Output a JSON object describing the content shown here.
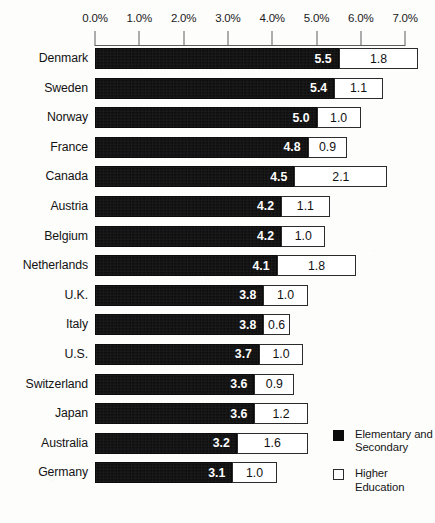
{
  "chart_data": {
    "type": "bar",
    "orientation": "horizontal",
    "stacked": true,
    "title": "",
    "subtitle": "",
    "xlabel": "",
    "ylabel": "",
    "xlim": [
      0.0,
      7.0
    ],
    "grid": false,
    "legend_position": "bottom-right",
    "axis_tick_labels": [
      "0.0%",
      "1.0%",
      "2.0%",
      "3.0%",
      "4.0%",
      "5.0%",
      "6.0%",
      "7.0%"
    ],
    "axis_tick_values": [
      0.0,
      1.0,
      2.0,
      3.0,
      4.0,
      5.0,
      6.0,
      7.0
    ],
    "categories": [
      "Denmark",
      "Sweden",
      "Norway",
      "France",
      "Canada",
      "Austria",
      "Belgium",
      "Netherlands",
      "U.K.",
      "Italy",
      "U.S.",
      "Switzerland",
      "Japan",
      "Australia",
      "Germany"
    ],
    "series": [
      {
        "name": "Elementary and Secondary",
        "color": "#0b0b0b",
        "values": [
          5.5,
          5.4,
          5.0,
          4.8,
          4.5,
          4.2,
          4.2,
          4.1,
          3.8,
          3.8,
          3.7,
          3.6,
          3.6,
          3.2,
          3.1
        ]
      },
      {
        "name": "Higher Education",
        "color": "#ffffff",
        "values": [
          1.8,
          1.1,
          1.0,
          0.9,
          2.1,
          1.1,
          1.0,
          1.8,
          1.0,
          0.6,
          1.0,
          0.9,
          1.2,
          1.6,
          1.0
        ]
      }
    ],
    "value_labels": {
      "primary": [
        "5.5",
        "5.4",
        "5.0",
        "4.8",
        "4.5",
        "4.2",
        "4.2",
        "4.1",
        "3.8",
        "3.8",
        "3.7",
        "3.6",
        "3.6",
        "3.2",
        "3.1"
      ],
      "secondary": [
        "1.8",
        "1.1",
        "1.0",
        "0.9",
        "2.1",
        "1.1",
        "1.0",
        "1.8",
        "1.0",
        "0.6",
        "1.0",
        "0.9",
        "1.2",
        "1.6",
        "1.0"
      ]
    }
  },
  "legend": {
    "items": [
      {
        "label": "Elementary and Secondary",
        "swatch": "filled-square-icon"
      },
      {
        "label": "Higher Education",
        "swatch": "hollow-square-icon"
      }
    ]
  },
  "colors": {
    "primary": "#0b0b0b",
    "secondary": "#ffffff",
    "outline": "#2b2b2b",
    "axis": "#5d5d5d",
    "text": "#131313",
    "background": "#fdfdfc"
  }
}
